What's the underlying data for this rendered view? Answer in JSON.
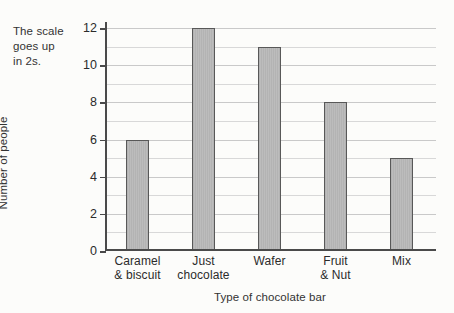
{
  "annotation": {
    "text": "The scale\ngoes up\nin 2s."
  },
  "chart_data": {
    "type": "bar",
    "title": "",
    "xlabel": "Type of chocolate bar",
    "ylabel": "Number of people",
    "categories": [
      "Caramel\n& biscuit",
      "Just\nchocolate",
      "Wafer",
      "Fruit\n& Nut",
      "Mix"
    ],
    "values": [
      6,
      12,
      11,
      8,
      5
    ],
    "ylim": [
      0,
      12
    ],
    "ytick_step": 2,
    "ytick_labels": [
      "0",
      "2",
      "4",
      "6",
      "8",
      "10",
      "12"
    ],
    "minor_gridline_step": 1,
    "grid": true,
    "legend": "none",
    "bar_color": "#b7b7b7",
    "bar_edge_color": "#585858",
    "axis_color": "#4a4a4a",
    "grid_color": "#c9c9c9",
    "background": "#fcfcfa"
  }
}
